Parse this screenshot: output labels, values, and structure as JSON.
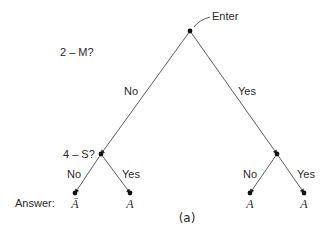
{
  "diagram": {
    "entry_label": "Enter",
    "caption": "(a)",
    "answer_row_label": "Answer:",
    "questions": [
      {
        "id": "root",
        "text": "2 – M?"
      },
      {
        "id": "left",
        "text": "4 – S?"
      }
    ],
    "edge_labels": {
      "root_no": "No",
      "root_yes": "Yes",
      "left_no": "No",
      "left_yes": "Yes",
      "right_no": "No",
      "right_yes": "Yes"
    },
    "answers": [
      {
        "path": "No, No",
        "text": "Ā"
      },
      {
        "path": "No, Yes",
        "text": "A"
      },
      {
        "path": "Yes, No",
        "text": "A"
      },
      {
        "path": "Yes, Yes",
        "text": "A"
      }
    ],
    "colors": {
      "ink": "#2a2a2a",
      "background": "#ffffff"
    }
  }
}
